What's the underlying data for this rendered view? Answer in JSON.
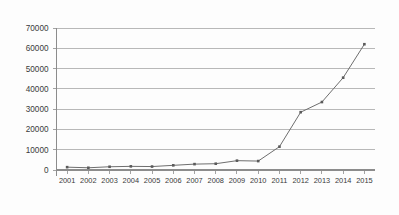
{
  "chart_data": {
    "type": "line",
    "title": "",
    "subtitle": "",
    "xlabel": "",
    "ylabel": "",
    "categories": [
      "2001",
      "2002",
      "2003",
      "2004",
      "2005",
      "2006",
      "2007",
      "2008",
      "2009",
      "2010",
      "2011",
      "2012",
      "2013",
      "2014",
      "2015"
    ],
    "values": [
      1400,
      1100,
      1600,
      1800,
      1700,
      2300,
      2900,
      3100,
      4600,
      4400,
      11500,
      28500,
      33500,
      45500,
      62000
    ],
    "series": [
      {
        "name": "",
        "values": [
          1400,
          1100,
          1600,
          1800,
          1700,
          2300,
          2900,
          3100,
          4600,
          4400,
          11500,
          28500,
          33500,
          45500,
          62000
        ]
      }
    ],
    "ylim": [
      0,
      70000
    ],
    "yticks": [
      0,
      10000,
      20000,
      30000,
      40000,
      50000,
      60000,
      70000
    ],
    "ytick_labels": [
      "0",
      "10000",
      "20000",
      "30000",
      "40000",
      "50000",
      "60000",
      "70000"
    ],
    "xtick_labels": [
      "2001",
      "2002",
      "2003",
      "2004",
      "2005",
      "2006",
      "2007",
      "2008",
      "2009",
      "2010",
      "2011",
      "2012",
      "2013",
      "2014",
      "2015"
    ],
    "grid": true,
    "grid_axis": "y",
    "legend": false,
    "legend_position": "none",
    "markers": true,
    "marker_shape": "square",
    "colors": {
      "line": "#6e6e6e",
      "marker": "#5a5a5a",
      "grid": "#9a9a9a",
      "axis": "#8c8c8c",
      "text": "#3a3a3a",
      "background": "#fdfdfd"
    }
  }
}
